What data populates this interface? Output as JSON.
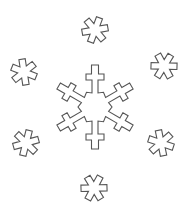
{
  "title": "Snowflakes coloring page",
  "drawing": {
    "style": "black outline line art on white",
    "line_color": "#555555",
    "background_color": "#ffffff",
    "main_snowflake": {
      "name": "large six-armed snowflake",
      "arms": 6,
      "center_shape": "hexagon",
      "arm_tip": "cross-bar"
    },
    "small_flakes": [
      {
        "id": "top",
        "arms": 6
      },
      {
        "id": "top-left",
        "arms": 6
      },
      {
        "id": "top-right",
        "arms": 6
      },
      {
        "id": "bottom-left",
        "arms": 6
      },
      {
        "id": "bottom-right",
        "arms": 6
      },
      {
        "id": "bottom",
        "arms": 6
      }
    ]
  }
}
